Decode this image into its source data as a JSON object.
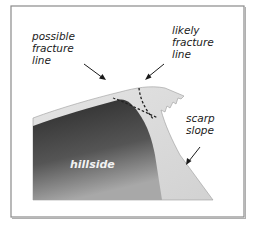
{
  "diagram": {
    "labels": {
      "possible": [
        "possible",
        "fracture",
        "line"
      ],
      "likely": [
        "likely",
        "fracture",
        "line"
      ],
      "scarp": [
        "scarp",
        "slope"
      ],
      "hillside": "hillside"
    },
    "colors": {
      "frame": "#8a8a8a",
      "hillside_dark": "#2e2e2e",
      "hillside_light": "#9a9a9a",
      "snow_layer": "#dcdcdc",
      "dash": "#222222",
      "text": "#1a1a1a"
    }
  }
}
